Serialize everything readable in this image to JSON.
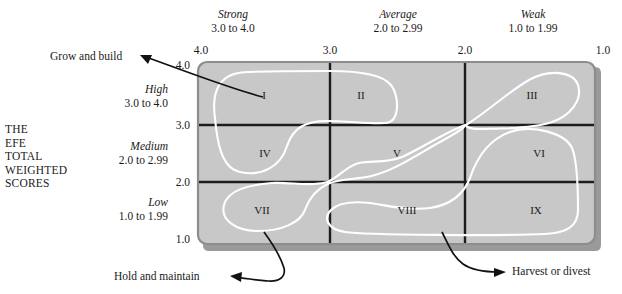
{
  "figure": {
    "type": "matrix-diagram",
    "name": "The Internal-External (IE) Matrix"
  },
  "axes": {
    "x": {
      "title": "THE IFE TOTAL WEIGHTED SCORES",
      "segments": [
        {
          "name": "Strong",
          "range": "3.0 to 4.0"
        },
        {
          "name": "Average",
          "range": "2.0 to 2.99"
        },
        {
          "name": "Weak",
          "range": "1.0 to 1.99"
        }
      ],
      "ticks": [
        "4.0",
        "3.0",
        "2.0",
        "1.0"
      ]
    },
    "y": {
      "title": "THE\nEFE\nTOTAL\nWEIGHTED\nSCORES",
      "segments": [
        {
          "name": "High",
          "range": "3.0 to 4.0"
        },
        {
          "name": "Medium",
          "range": "2.0 to 2.99"
        },
        {
          "name": "Low",
          "range": "1.0 to 1.99"
        }
      ],
      "ticks": [
        "4.0",
        "3.0",
        "2.0",
        "1.0"
      ]
    }
  },
  "cells": [
    {
      "id": "I",
      "label": "I"
    },
    {
      "id": "II",
      "label": "II"
    },
    {
      "id": "III",
      "label": "III"
    },
    {
      "id": "IV",
      "label": "IV"
    },
    {
      "id": "V",
      "label": "V"
    },
    {
      "id": "VI",
      "label": "VI"
    },
    {
      "id": "VII",
      "label": "VII"
    },
    {
      "id": "VIII",
      "label": "VIII"
    },
    {
      "id": "IX",
      "label": "IX"
    }
  ],
  "callouts": [
    {
      "id": "grow",
      "label": "Grow and build"
    },
    {
      "id": "hold",
      "label": "Hold and maintain"
    },
    {
      "id": "harvest",
      "label": "Harvest or divest"
    }
  ],
  "footnote": {
    "text": ""
  },
  "colors": {
    "panel_fill": "#c8c8c8",
    "panel_edge": "#8d8d8d",
    "panel_shadow": "#9a9a9a",
    "grid_line": "#1d1d1d",
    "region_line": "#ffffff",
    "text": "#1a1a1a",
    "arrow": "#111111"
  }
}
